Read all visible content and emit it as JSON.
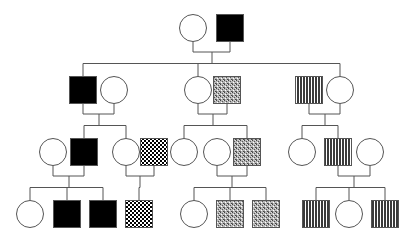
{
  "diagram": {
    "type": "pedigree",
    "generations": 4,
    "legend_fills": {
      "unaffected": "#ffffff",
      "solid": "#000000",
      "checker": "checkerboard",
      "dotted": "stipple",
      "striped": "vertical-stripes"
    },
    "colors": {
      "line": "#555555",
      "fill_dark": "#000000",
      "background": "#ffffff"
    },
    "individuals": [
      {
        "id": "I-1",
        "gen": 1,
        "sex": "female",
        "fill": "unaffected",
        "cx": 193,
        "cy": 28
      },
      {
        "id": "I-2",
        "gen": 1,
        "sex": "male",
        "fill": "solid",
        "cx": 230,
        "cy": 28
      },
      {
        "id": "II-1",
        "gen": 2,
        "sex": "male",
        "fill": "solid",
        "cx": 83,
        "cy": 90
      },
      {
        "id": "II-2",
        "gen": 2,
        "sex": "female",
        "fill": "unaffected",
        "cx": 114,
        "cy": 90
      },
      {
        "id": "II-3",
        "gen": 2,
        "sex": "female",
        "fill": "unaffected",
        "cx": 198,
        "cy": 90
      },
      {
        "id": "II-4",
        "gen": 2,
        "sex": "male",
        "fill": "dotted",
        "cx": 227,
        "cy": 90
      },
      {
        "id": "II-5",
        "gen": 2,
        "sex": "male",
        "fill": "striped",
        "cx": 309,
        "cy": 90
      },
      {
        "id": "II-6",
        "gen": 2,
        "sex": "female",
        "fill": "unaffected",
        "cx": 340,
        "cy": 90
      },
      {
        "id": "III-1",
        "gen": 3,
        "sex": "female",
        "fill": "unaffected",
        "cx": 53,
        "cy": 152
      },
      {
        "id": "III-2",
        "gen": 3,
        "sex": "male",
        "fill": "solid",
        "cx": 84,
        "cy": 152
      },
      {
        "id": "III-3",
        "gen": 3,
        "sex": "female",
        "fill": "unaffected",
        "cx": 126,
        "cy": 152
      },
      {
        "id": "III-4",
        "gen": 3,
        "sex": "male",
        "fill": "checker",
        "cx": 154,
        "cy": 152
      },
      {
        "id": "III-5",
        "gen": 3,
        "sex": "female",
        "fill": "unaffected",
        "cx": 184,
        "cy": 152
      },
      {
        "id": "III-6",
        "gen": 3,
        "sex": "female",
        "fill": "unaffected",
        "cx": 217,
        "cy": 152
      },
      {
        "id": "III-7",
        "gen": 3,
        "sex": "male",
        "fill": "dotted",
        "cx": 247,
        "cy": 152
      },
      {
        "id": "III-8",
        "gen": 3,
        "sex": "female",
        "fill": "unaffected",
        "cx": 302,
        "cy": 152
      },
      {
        "id": "III-9",
        "gen": 3,
        "sex": "male",
        "fill": "striped",
        "cx": 338,
        "cy": 152
      },
      {
        "id": "III-10",
        "gen": 3,
        "sex": "female",
        "fill": "unaffected",
        "cx": 370,
        "cy": 152
      },
      {
        "id": "IV-1",
        "gen": 4,
        "sex": "female",
        "fill": "unaffected",
        "cx": 30,
        "cy": 214
      },
      {
        "id": "IV-2",
        "gen": 4,
        "sex": "male",
        "fill": "solid",
        "cx": 67,
        "cy": 214
      },
      {
        "id": "IV-3",
        "gen": 4,
        "sex": "male",
        "fill": "solid",
        "cx": 103,
        "cy": 214
      },
      {
        "id": "IV-4",
        "gen": 4,
        "sex": "male",
        "fill": "checker",
        "cx": 139,
        "cy": 214
      },
      {
        "id": "IV-5",
        "gen": 4,
        "sex": "female",
        "fill": "unaffected",
        "cx": 194,
        "cy": 214
      },
      {
        "id": "IV-6",
        "gen": 4,
        "sex": "male",
        "fill": "dotted",
        "cx": 230,
        "cy": 214
      },
      {
        "id": "IV-7",
        "gen": 4,
        "sex": "male",
        "fill": "dotted",
        "cx": 266,
        "cy": 214
      },
      {
        "id": "IV-8",
        "gen": 4,
        "sex": "male",
        "fill": "striped",
        "cx": 316,
        "cy": 214
      },
      {
        "id": "IV-9",
        "gen": 4,
        "sex": "female",
        "fill": "unaffected",
        "cx": 349,
        "cy": 214
      },
      {
        "id": "IV-10",
        "gen": 4,
        "sex": "male",
        "fill": "striped",
        "cx": 385,
        "cy": 214
      }
    ],
    "families": [
      {
        "parents": [
          "I-1",
          "I-2"
        ],
        "children": [
          "II-1",
          "II-3",
          "II-6"
        ]
      },
      {
        "parents": [
          "II-1",
          "II-2"
        ],
        "children": [
          "III-2",
          "III-3"
        ]
      },
      {
        "parents": [
          "II-3",
          "II-4"
        ],
        "children": [
          "III-5",
          "III-7"
        ]
      },
      {
        "parents": [
          "II-5",
          "II-6"
        ],
        "children": [
          "III-8",
          "III-9"
        ]
      },
      {
        "parents": [
          "III-1",
          "III-2"
        ],
        "children": [
          "IV-1",
          "IV-2",
          "IV-3"
        ]
      },
      {
        "parents": [
          "III-3",
          "III-4"
        ],
        "children": [
          "IV-4"
        ]
      },
      {
        "parents": [
          "III-6",
          "III-7"
        ],
        "children": [
          "IV-5",
          "IV-6",
          "IV-7"
        ]
      },
      {
        "parents": [
          "III-9",
          "III-10"
        ],
        "children": [
          "IV-8",
          "IV-9",
          "IV-10"
        ]
      }
    ]
  }
}
